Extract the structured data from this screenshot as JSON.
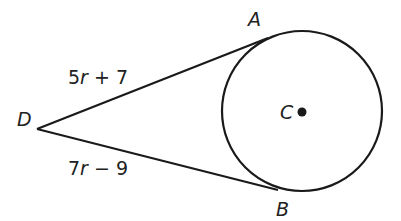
{
  "diagram": {
    "type": "circle with two tangent segments from external point",
    "points": {
      "A": {
        "label": "A",
        "role": "point of tangency"
      },
      "B": {
        "label": "B",
        "role": "point of tangency"
      },
      "C": {
        "label": "C",
        "role": "center of circle"
      },
      "D": {
        "label": "D",
        "role": "external point"
      }
    },
    "segments": {
      "DA": {
        "label_coef": "5",
        "label_var": "r",
        "label_rest": " + 7",
        "full": "5r + 7"
      },
      "DB": {
        "label_coef": "7",
        "label_var": "r",
        "label_rest": " − 9",
        "full": "7r − 9"
      }
    },
    "colors": {
      "stroke": "#1a1a1a",
      "background": "#ffffff"
    }
  }
}
